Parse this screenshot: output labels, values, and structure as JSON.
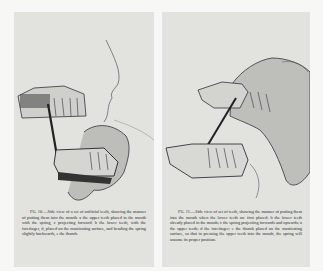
{
  "figures": [
    {
      "id": "fig-10",
      "label": "Fig. 10.",
      "caption": "—Side view of a set of artificial teeth, showing the manner of putting them into the mouth. a the upper teeth placed in the mouth with the spring, c projecting forward; b the lower teeth, with the forefinger, d, placed on the masticating surface, and bending the spring slightly backwards, e the thumb."
    },
    {
      "id": "fig-11",
      "label": "Fig. 11.",
      "caption": "—Side view of set of teeth, showing the manner of putting them into the mouth when the lower teeth are first placed; b the lower teeth already placed in the mouth; c the spring projecting forwards and upwards; a the upper teeth; d the forefinger; e the thumb placed on the masticating surface, so that in pressing the upper teeth into the mouth, the spring will assume its proper position."
    }
  ],
  "colors": {
    "paper": "#e2e2df",
    "ink": "#2c2c2c",
    "background": "#f7f7f5"
  }
}
